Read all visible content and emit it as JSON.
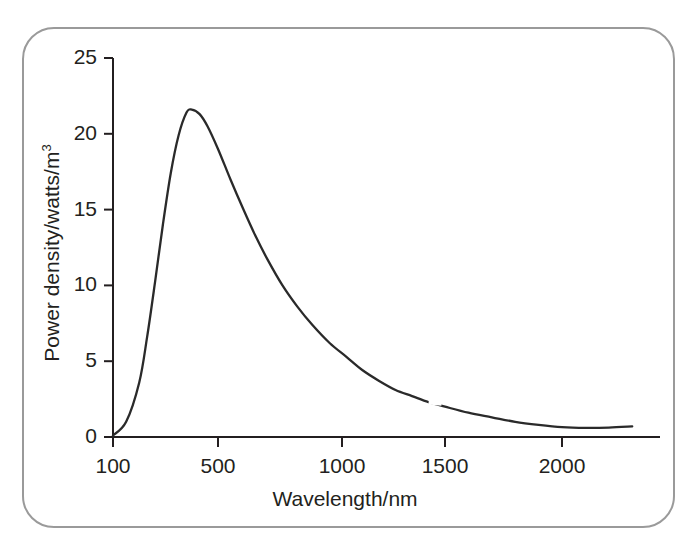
{
  "figure": {
    "border_color": "#9a9a9a",
    "background": "#ffffff"
  },
  "chart_data": {
    "type": "line",
    "title": "",
    "subtitle": "",
    "xlabel": "Wavelength/nm",
    "ylabel": "Power density/watts/m",
    "ylabel_exponent": "3",
    "xtick_labels": [
      "100",
      "500",
      "1000",
      "1500",
      "2000"
    ],
    "xtick_values": [
      100,
      500,
      1000,
      1500,
      2000
    ],
    "ytick_labels": [
      "0",
      "5",
      "10",
      "15",
      "20",
      "25"
    ],
    "ytick_values": [
      0,
      5,
      10,
      15,
      20,
      25
    ],
    "ylim": [
      0,
      25
    ],
    "xlim": [
      100,
      2300
    ],
    "grid": false,
    "legend": null,
    "line_color": "#2a2a2a",
    "line_width": 2.2,
    "annotations": [],
    "series": [
      {
        "name": "Spectral power density",
        "peak_x": 400,
        "peak_y": 21.6,
        "x": [
          100,
          150,
          200,
          230,
          260,
          290,
          320,
          350,
          380,
          400,
          430,
          460,
          500,
          550,
          600,
          650,
          700,
          760,
          820,
          880,
          950,
          1020,
          1100,
          1180,
          1260,
          1340,
          1420,
          1500,
          1600,
          1700,
          1800,
          1900,
          2000,
          2100,
          2200,
          2300
        ],
        "values": [
          0.1,
          1.0,
          3.6,
          6.6,
          10.2,
          14.0,
          17.4,
          19.9,
          21.4,
          21.6,
          21.3,
          20.5,
          19.0,
          17.0,
          15.1,
          13.3,
          11.7,
          10.0,
          8.6,
          7.4,
          6.2,
          5.3,
          4.4,
          3.7,
          3.1,
          2.7,
          2.3,
          2.0,
          1.6,
          1.3,
          1.0,
          0.8,
          0.65,
          0.6,
          0.62,
          0.7
        ]
      }
    ]
  },
  "geometry": {
    "x_axis_y_px": 437,
    "y_axis_x_px": 113,
    "y_top_px": 58,
    "x_tick_px": [
      113,
      218,
      342,
      445,
      562
    ],
    "x_right_px": 660
  },
  "artifact": {
    "gap_center_x_px": 435,
    "gap_width_px": 13
  }
}
